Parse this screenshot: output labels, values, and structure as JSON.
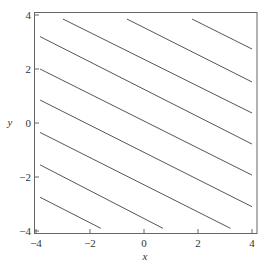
{
  "chart_data": {
    "type": "line",
    "title": "",
    "xlabel": "x",
    "ylabel": "y",
    "xlim": [
      -4,
      4
    ],
    "ylim": [
      -4,
      4
    ],
    "x_ticks": [
      -4,
      -2,
      0,
      2,
      4
    ],
    "y_ticks": [
      -4,
      -2,
      0,
      2,
      4
    ],
    "x_tick_labels": [
      "−4",
      "−2",
      "0",
      "2",
      "4"
    ],
    "y_tick_labels": [
      "−4",
      "−2",
      "0",
      "2",
      "4"
    ],
    "grid": false,
    "legend": null,
    "line_color": "#555555",
    "series": [
      {
        "name": "c=9.5",
        "x": [
          1.78,
          4.0
        ],
        "y": [
          3.85,
          2.74
        ]
      },
      {
        "name": "c=7.1",
        "x": [
          -0.63,
          4.0
        ],
        "y": [
          3.85,
          1.52
        ]
      },
      {
        "name": "c=4.7",
        "x": [
          -3.0,
          4.0
        ],
        "y": [
          3.85,
          0.37
        ]
      },
      {
        "name": "c=2.4",
        "x": [
          -3.85,
          4.0
        ],
        "y": [
          3.2,
          -0.78
        ]
      },
      {
        "name": "c=0.1",
        "x": [
          -3.85,
          4.0
        ],
        "y": [
          2.0,
          -1.93
        ]
      },
      {
        "name": "c=-2.2",
        "x": [
          -3.85,
          4.0
        ],
        "y": [
          0.85,
          -3.1
        ]
      },
      {
        "name": "c=-4.6",
        "x": [
          -3.85,
          3.2
        ],
        "y": [
          -0.35,
          -3.9
        ]
      },
      {
        "name": "c=-7.0",
        "x": [
          -3.85,
          0.7
        ],
        "y": [
          -1.55,
          -3.9
        ]
      },
      {
        "name": "c=-9.4",
        "x": [
          -3.85,
          -1.6
        ],
        "y": [
          -2.75,
          -3.9
        ]
      }
    ]
  }
}
